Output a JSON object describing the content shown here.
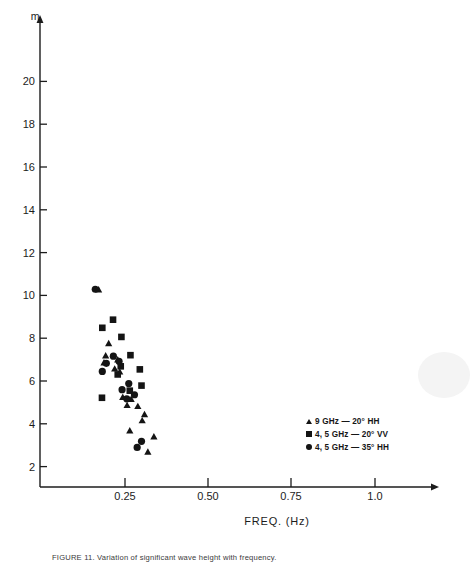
{
  "figure": {
    "caption": "FIGURE 11. Variation of significant wave height with frequency.",
    "unit_label": "m",
    "xlabel": "FREQ. (Hz)"
  },
  "axes": {
    "y_ticks": [
      "2",
      "4",
      "6",
      "8",
      "10",
      "12",
      "14",
      "16",
      "18",
      "20"
    ],
    "x_ticks": [
      "0.25",
      "0.50",
      "0.75",
      "1.0"
    ]
  },
  "legend": {
    "items": [
      {
        "marker": "triangle",
        "label": "9 GHz — 20° HH"
      },
      {
        "marker": "square",
        "label": "4,  5 GHz — 20° VV"
      },
      {
        "marker": "circle",
        "label": "4, 5 GHz — 35° HH"
      }
    ]
  },
  "chart_data": {
    "type": "scatter",
    "title": "",
    "xlabel": "FREQ. (Hz)",
    "ylabel": "m",
    "xlim": [
      0,
      1.08
    ],
    "ylim": [
      0,
      21.5
    ],
    "xticks": [
      0.25,
      0.5,
      0.75,
      1.0
    ],
    "yticks": [
      2,
      4,
      6,
      8,
      10,
      12,
      14,
      16,
      18,
      20
    ],
    "grid": false,
    "legend_position": "lower-right",
    "series": [
      {
        "name": "9 GHz — 20° HH",
        "marker": "triangle",
        "points": [
          [
            0.175,
            9.75
          ],
          [
            0.205,
            7.1
          ],
          [
            0.196,
            6.5
          ],
          [
            0.232,
            6.3
          ],
          [
            0.191,
            6.15
          ],
          [
            0.223,
            5.85
          ],
          [
            0.238,
            5.7
          ],
          [
            0.247,
            4.45
          ],
          [
            0.272,
            4.35
          ],
          [
            0.26,
            4.05
          ],
          [
            0.292,
            4.0
          ],
          [
            0.312,
            3.6
          ],
          [
            0.305,
            3.3
          ],
          [
            0.268,
            2.8
          ],
          [
            0.34,
            2.5
          ],
          [
            0.322,
            1.75
          ]
        ]
      },
      {
        "name": "4,  5 GHz — 20° VV",
        "marker": "square",
        "points": [
          [
            0.218,
            8.25
          ],
          [
            0.186,
            7.85
          ],
          [
            0.243,
            7.4
          ],
          [
            0.27,
            6.5
          ],
          [
            0.241,
            5.95
          ],
          [
            0.298,
            5.8
          ],
          [
            0.232,
            5.55
          ],
          [
            0.303,
            5.0
          ],
          [
            0.268,
            4.75
          ],
          [
            0.185,
            4.4
          ]
        ]
      },
      {
        "name": "4, 5 GHz — 35° HH",
        "marker": "circle",
        "points": [
          [
            0.165,
            9.75
          ],
          [
            0.219,
            6.45
          ],
          [
            0.236,
            6.2
          ],
          [
            0.198,
            6.1
          ],
          [
            0.186,
            5.7
          ],
          [
            0.265,
            5.1
          ],
          [
            0.245,
            4.8
          ],
          [
            0.282,
            4.55
          ],
          [
            0.259,
            4.35
          ],
          [
            0.303,
            2.25
          ],
          [
            0.29,
            1.95
          ]
        ]
      }
    ]
  }
}
